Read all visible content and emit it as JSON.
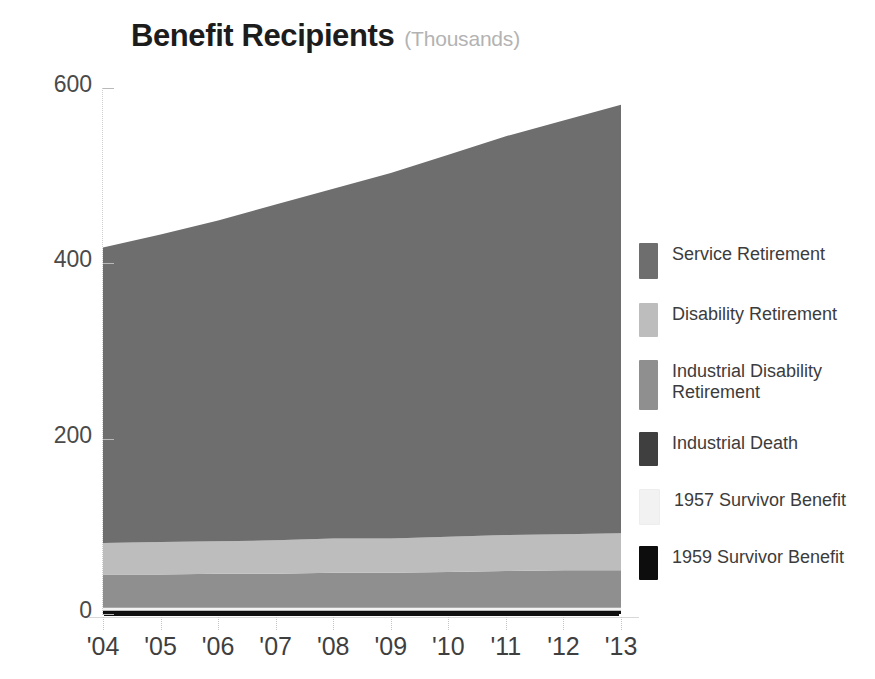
{
  "chart": {
    "title": "Benefit Recipients",
    "subtitle": "(Thousands)"
  },
  "legend": {
    "items": [
      {
        "label": "Service Retirement",
        "color": "#6e6e6e"
      },
      {
        "label": "Disability Retirement",
        "color": "#bdbdbd"
      },
      {
        "label": "Industrial Disability\nRetirement",
        "color": "#8f8f8f"
      },
      {
        "label": "Industrial Death",
        "color": "#3f3f3f"
      },
      {
        "label": "1957 Survivor Benefit",
        "color": "#f2f2f2"
      },
      {
        "label": "1959 Survivor Benefit",
        "color": "#0d0d0d"
      }
    ]
  },
  "chart_data": {
    "type": "area",
    "stacked": true,
    "title": "Benefit Recipients",
    "subtitle": "(Thousands)",
    "xlabel": "",
    "ylabel": "Thousands",
    "ylim": [
      0,
      600
    ],
    "yticks": [
      0,
      200,
      400,
      600
    ],
    "ytick_labels": [
      "0",
      "200",
      "400",
      "600"
    ],
    "grid": false,
    "legend_position": "right",
    "categories": [
      "'04",
      "'05",
      "'06",
      "'07",
      "'08",
      "'09",
      "'10",
      "'11",
      "'12",
      "'13"
    ],
    "x": [
      2004,
      2005,
      2006,
      2007,
      2008,
      2009,
      2010,
      2011,
      2012,
      2013
    ],
    "series": [
      {
        "name": "1959 Survivor Benefit",
        "color": "#0d0d0d",
        "values": [
          4,
          4,
          4,
          4,
          4,
          4,
          4,
          4,
          4,
          4
        ]
      },
      {
        "name": "1957 Survivor Benefit",
        "color": "#f2f2f2",
        "values": [
          3,
          3,
          3,
          3,
          3,
          3,
          3,
          3,
          3,
          3
        ]
      },
      {
        "name": "Industrial Disability\nRetirement",
        "color": "#8f8f8f",
        "values": [
          38,
          38,
          39,
          39,
          40,
          40,
          41,
          42,
          43,
          43
        ]
      },
      {
        "name": "Disability Retirement",
        "color": "#bdbdbd",
        "values": [
          36,
          37,
          37,
          38,
          39,
          39,
          40,
          41,
          41,
          42
        ]
      },
      {
        "name": "Service Retirement",
        "color": "#6e6e6e",
        "values": [
          337,
          351,
          366,
          383,
          399,
          417,
          436,
          455,
          472,
          489
        ]
      }
    ],
    "totals": [
      418,
      433,
      449,
      467,
      485,
      503,
      524,
      545,
      563,
      581
    ]
  }
}
